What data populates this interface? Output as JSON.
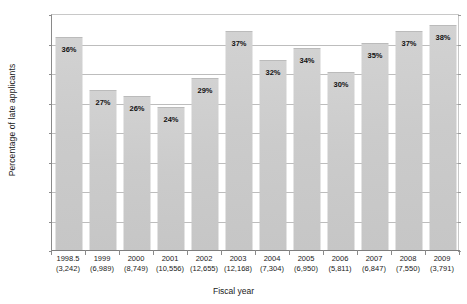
{
  "chart_data": {
    "type": "bar",
    "title": "",
    "xlabel": "Fiscal year",
    "ylabel": "Percentage of late applicants",
    "ylim": [
      0,
      40
    ],
    "ytick_labels": [
      "0%",
      "5%",
      "10%",
      "15%",
      "20%",
      "25%",
      "30%",
      "35%",
      "40%"
    ],
    "ytick_values": [
      0,
      5,
      10,
      15,
      20,
      25,
      30,
      35,
      40
    ],
    "grid": true,
    "legend": "none",
    "categories": [
      "1998.5",
      "1999",
      "2000",
      "2001",
      "2002",
      "2003",
      "2004",
      "2005",
      "2006",
      "2007",
      "2008",
      "2009"
    ],
    "category_counts": [
      "(3,242)",
      "(6,989)",
      "(8,749)",
      "(10,556)",
      "(12,655)",
      "(12,168)",
      "(7,304)",
      "(6,950)",
      "(5,811)",
      "(6,847)",
      "(7,550)",
      "(3,791)"
    ],
    "values": [
      36,
      27,
      26,
      24,
      29,
      37,
      32,
      34,
      30,
      35,
      37,
      38
    ],
    "value_labels": [
      "36%",
      "27%",
      "26%",
      "24%",
      "29%",
      "37%",
      "32%",
      "34%",
      "30%",
      "35%",
      "37%",
      "38%"
    ],
    "bar_color": "#cccccc",
    "grid_color": "#bdbdbd",
    "axis_color": "#8a8a8a",
    "text_color": "#1a1a1a",
    "background": "#ffffff"
  }
}
